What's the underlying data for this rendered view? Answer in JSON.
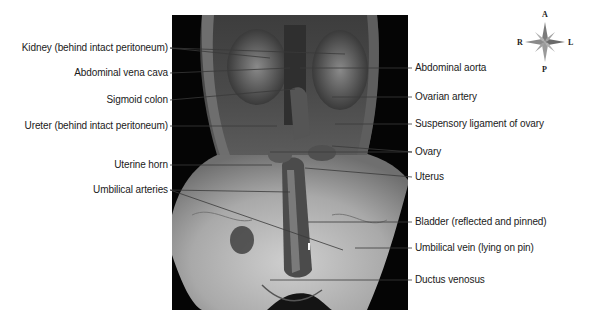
{
  "figure": {
    "type": "labeled dissection photograph",
    "colors": {
      "background": "#ffffff",
      "photo_background": "#050505",
      "label_text": "#1a1a1a",
      "leader_line": "#3a3a3a"
    }
  },
  "labels_left": [
    {
      "id": "kidney",
      "text": "Kidney (behind intact peritoneum)"
    },
    {
      "id": "abdominal-vena-cava",
      "text": "Abdominal vena cava"
    },
    {
      "id": "sigmoid-colon",
      "text": "Sigmoid colon"
    },
    {
      "id": "ureter",
      "text": "Ureter (behind intact peritoneum)"
    },
    {
      "id": "uterine-horn",
      "text": "Uterine horn"
    },
    {
      "id": "umbilical-arteries",
      "text": "Umbilical arteries"
    }
  ],
  "labels_right": [
    {
      "id": "abdominal-aorta",
      "text": "Abdominal aorta"
    },
    {
      "id": "ovarian-artery",
      "text": "Ovarian artery"
    },
    {
      "id": "suspensory-ligament",
      "text": "Suspensory ligament of ovary"
    },
    {
      "id": "ovary",
      "text": "Ovary"
    },
    {
      "id": "uterus",
      "text": "Uterus"
    },
    {
      "id": "bladder",
      "text": "Bladder (reflected and pinned)"
    },
    {
      "id": "umbilical-vein",
      "text": "Umbilical vein (lying on pin)"
    },
    {
      "id": "ductus-venosus",
      "text": "Ductus venosus"
    }
  ],
  "compass": {
    "icon": "compass-rose-icon",
    "anterior": "A",
    "posterior": "P",
    "right": "R",
    "left": "L"
  }
}
